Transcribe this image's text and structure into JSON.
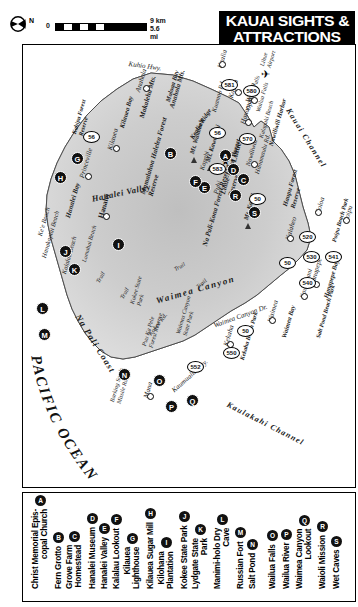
{
  "title": {
    "line1": "KAUAI SIGHTS &",
    "line2": "ATTRACTIONS",
    "bg_color": "#000000",
    "text_color": "#ffffff"
  },
  "compass": {
    "icon": "compass-north-arrow",
    "label": "N"
  },
  "scale": {
    "zero": "0",
    "km": "9 km",
    "mi": "5.6 mi"
  },
  "ocean": {
    "label": "PACIFIC OCEAN"
  },
  "channels": [
    {
      "name": "Kauai Channel"
    },
    {
      "name": "Kaulakahi Channel"
    }
  ],
  "map_labels": [
    {
      "name": "Kuhio Hwy."
    },
    {
      "name": "Kuhio Hwy."
    },
    {
      "name": "Anahola"
    },
    {
      "name": "Kealia"
    },
    {
      "name": "Kapaa"
    },
    {
      "name": "Wailua"
    },
    {
      "name": "Hanamaulu"
    },
    {
      "name": "Lihue"
    },
    {
      "name": "Nawiliwili"
    },
    {
      "name": "Nawiliwili Harbor"
    },
    {
      "name": "Kalapaki Beach"
    },
    {
      "name": "Hanamaulu Rd."
    },
    {
      "name": "Puhi"
    },
    {
      "name": "Koloa"
    },
    {
      "name": "Poipu"
    },
    {
      "name": "Poipu Beach Park"
    },
    {
      "name": "Kalaheo"
    },
    {
      "name": "Hanapepe"
    },
    {
      "name": "Hanapepe Bay"
    },
    {
      "name": "Kaumakani"
    },
    {
      "name": "Salt Pond Beach Park"
    },
    {
      "name": "Waimea"
    },
    {
      "name": "Waimea Bay"
    },
    {
      "name": "Kekaha"
    },
    {
      "name": "Kekaha Beach Park"
    },
    {
      "name": "Kaumualii Hwy."
    },
    {
      "name": "Mana"
    },
    {
      "name": "Barking Sands Missile Range"
    },
    {
      "name": "Waimea Canyon"
    },
    {
      "name": "Waimea Canyon Dr."
    },
    {
      "name": "Waimea Canyon State Park"
    },
    {
      "name": "Kokee State Park"
    },
    {
      "name": "Kokee Rd."
    },
    {
      "name": "Puu Ka Pele Forest Reserve"
    },
    {
      "name": "Na Pali Coast"
    },
    {
      "name": "Kalalau Beach"
    },
    {
      "name": "Hanakapiai Beach"
    },
    {
      "name": "Ke'e Beach"
    },
    {
      "name": "Hanalei"
    },
    {
      "name": "Hanalei Bay"
    },
    {
      "name": "Hanalei Valley"
    },
    {
      "name": "Lumahai Beach"
    },
    {
      "name": "Princeville"
    },
    {
      "name": "Kilauea"
    },
    {
      "name": "Kilauea Bay"
    },
    {
      "name": "Moloaa Bay"
    },
    {
      "name": "Makaleha Mts."
    },
    {
      "name": "Anahola Mts."
    },
    {
      "name": "Kealia Ridge"
    },
    {
      "name": "Kapahi"
    },
    {
      "name": "Kuamoo Rd."
    },
    {
      "name": "Opaekaa Falls"
    },
    {
      "name": "Wailua Falls"
    },
    {
      "name": "Mamalahoa Halelea Forest Reserve"
    },
    {
      "name": "Na Pali-Kona Forest Reserve"
    },
    {
      "name": "Lihue-Koloa Forest Reserve"
    },
    {
      "name": "Haupu Forest Reserve"
    },
    {
      "name": "Kahipa Forest Reserve"
    },
    {
      "name": "Mt. Waialeale"
    },
    {
      "name": "Mt. Kawaikini"
    },
    {
      "name": "Mt. Kahili"
    },
    {
      "name": "Trail"
    },
    {
      "name": "Lihue Airport"
    }
  ],
  "route_shields": [
    "56",
    "56",
    "50",
    "50",
    "50",
    "580",
    "581",
    "583",
    "570",
    "520",
    "530",
    "540",
    "541",
    "550",
    "552"
  ],
  "map_markers": [
    {
      "letter": "A",
      "x": 196,
      "y": 104
    },
    {
      "letter": "B",
      "x": 141,
      "y": 102
    },
    {
      "letter": "C",
      "x": 214,
      "y": 128
    },
    {
      "letter": "D",
      "x": 204,
      "y": 118
    },
    {
      "letter": "E",
      "x": 175,
      "y": 136
    },
    {
      "letter": "F",
      "x": 166,
      "y": 130
    },
    {
      "letter": "G",
      "x": 48,
      "y": 107
    },
    {
      "letter": "H",
      "x": 31,
      "y": 126
    },
    {
      "letter": "I",
      "x": 89,
      "y": 193
    },
    {
      "letter": "J",
      "x": 36,
      "y": 200
    },
    {
      "letter": "K",
      "x": 45,
      "y": 218
    },
    {
      "letter": "L",
      "x": 13,
      "y": 257
    },
    {
      "letter": "M",
      "x": 15,
      "y": 283
    },
    {
      "letter": "N",
      "x": 95,
      "y": 323
    },
    {
      "letter": "O",
      "x": 130,
      "y": 329
    },
    {
      "letter": "P",
      "x": 142,
      "y": 355
    },
    {
      "letter": "Q",
      "x": 163,
      "y": 349
    },
    {
      "letter": "R",
      "x": 206,
      "y": 144
    },
    {
      "letter": "S",
      "x": 225,
      "y": 161
    }
  ],
  "legend": {
    "entries": [
      {
        "marker": "A",
        "line1": "Christ Memorial Epis-",
        "line2": "copal Church"
      },
      {
        "marker": "B",
        "line1": "Fern Grotto",
        "line2": ""
      },
      {
        "marker": "C",
        "line1": "Grove Farm",
        "line2": "Homestead"
      },
      {
        "marker": "D",
        "line1": "Hanalei Museum",
        "line2": ""
      },
      {
        "marker": "E",
        "line1": "Hanalei Valley",
        "line2": ""
      },
      {
        "marker": "F",
        "line1": "Kalalau Lookout",
        "line2": ""
      },
      {
        "marker": "G",
        "line1": "Kilauea",
        "line2": "Lighthouse"
      },
      {
        "marker": "H",
        "line1": "Kilauea Sugar Mill",
        "line2": ""
      },
      {
        "marker": "I",
        "line1": "Kilohana",
        "line2": "Plantation"
      },
      {
        "marker": "J",
        "line1": "Kokee State Park",
        "line2": ""
      },
      {
        "marker": "K",
        "line1": "Lydgate State",
        "line2": "Park"
      },
      {
        "marker": "L",
        "line1": "Manimi-holo Dry",
        "line2": "Cave"
      },
      {
        "marker": "M",
        "line1": "Russian Fort",
        "line2": ""
      },
      {
        "marker": "N",
        "line1": "Salt Pond",
        "line2": ""
      },
      {
        "marker": "O",
        "line1": "Wailua Falls",
        "line2": ""
      },
      {
        "marker": "P",
        "line1": "Wailua River",
        "line2": ""
      },
      {
        "marker": "Q",
        "line1": "Waimea Canyon",
        "line2": "Lookout"
      },
      {
        "marker": "R",
        "line1": "Waioli Mission",
        "line2": ""
      },
      {
        "marker": "S",
        "line1": "Wet Caves",
        "line2": ""
      }
    ]
  }
}
